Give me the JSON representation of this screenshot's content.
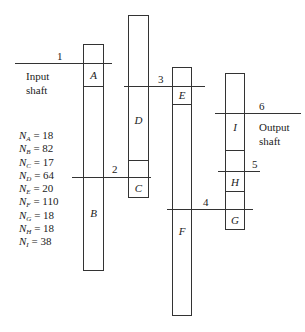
{
  "diagram": {
    "shafts": [
      {
        "id": "1",
        "label": "1",
        "note": "Input shaft"
      },
      {
        "id": "2",
        "label": "2"
      },
      {
        "id": "3",
        "label": "3"
      },
      {
        "id": "4",
        "label": "4"
      },
      {
        "id": "5",
        "label": "5"
      },
      {
        "id": "6",
        "label": "6",
        "note": "Output shaft"
      }
    ],
    "input_label_line1": "Input",
    "input_label_line2": "shaft",
    "output_label_line1": "Output",
    "output_label_line2": "shaft",
    "gears": {
      "A": "A",
      "B": "B",
      "C": "C",
      "D": "D",
      "E": "E",
      "F": "F",
      "G": "G",
      "H": "H",
      "I": "I"
    },
    "tooth_counts": [
      {
        "gear": "A",
        "prefix": "N",
        "eq": " = 18"
      },
      {
        "gear": "B",
        "prefix": "N",
        "eq": " = 82"
      },
      {
        "gear": "C",
        "prefix": "N",
        "eq": " = 17"
      },
      {
        "gear": "D",
        "prefix": "N",
        "eq": " = 64"
      },
      {
        "gear": "E",
        "prefix": "N",
        "eq": " = 20"
      },
      {
        "gear": "F",
        "prefix": "N",
        "eq": " = 110"
      },
      {
        "gear": "G",
        "prefix": "N",
        "eq": " = 18"
      },
      {
        "gear": "H",
        "prefix": "N",
        "eq": " = 18"
      },
      {
        "gear": "I",
        "prefix": "N",
        "eq": " = 38"
      }
    ]
  }
}
